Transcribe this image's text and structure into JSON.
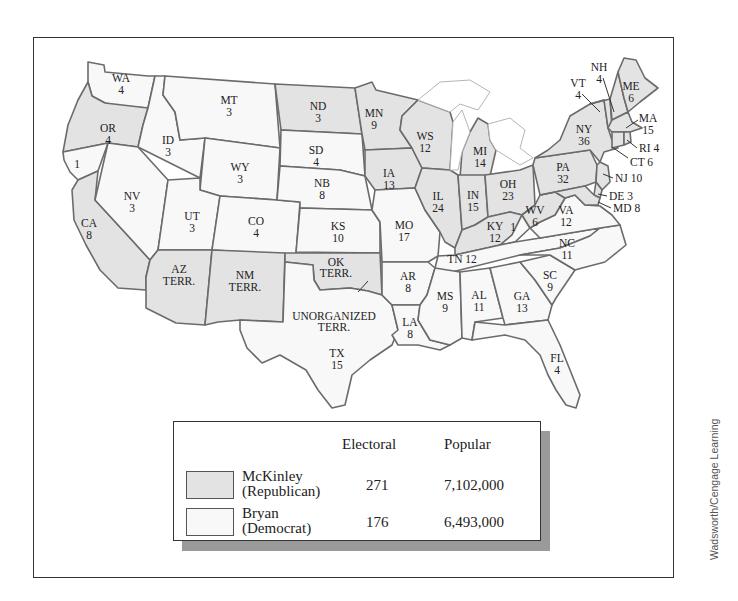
{
  "map": {
    "title": "Election of 1896",
    "colors": {
      "republican": "#e3e3e3",
      "democrat": "#f8f8f8",
      "border": "#6b6b6b"
    },
    "states": [
      {
        "abbr": "WA",
        "votes": "4",
        "party": "democrat"
      },
      {
        "abbr": "OR",
        "votes": "4",
        "party": "republican"
      },
      {
        "abbr": "CA",
        "votes": "8",
        "party": "republican",
        "split_note": "1"
      },
      {
        "abbr": "ID",
        "votes": "3",
        "party": "democrat"
      },
      {
        "abbr": "NV",
        "votes": "3",
        "party": "democrat"
      },
      {
        "abbr": "MT",
        "votes": "3",
        "party": "democrat"
      },
      {
        "abbr": "WY",
        "votes": "3",
        "party": "democrat"
      },
      {
        "abbr": "UT",
        "votes": "3",
        "party": "democrat"
      },
      {
        "abbr": "CO",
        "votes": "4",
        "party": "democrat"
      },
      {
        "abbr": "AZ",
        "votes": "TERR.",
        "party": "republican"
      },
      {
        "abbr": "NM",
        "votes": "TERR.",
        "party": "republican"
      },
      {
        "abbr": "ND",
        "votes": "3",
        "party": "republican"
      },
      {
        "abbr": "SD",
        "votes": "4",
        "party": "democrat"
      },
      {
        "abbr": "NB",
        "votes": "8",
        "party": "democrat"
      },
      {
        "abbr": "KS",
        "votes": "10",
        "party": "democrat"
      },
      {
        "abbr": "OK",
        "votes": "TERR.",
        "party": "republican"
      },
      {
        "abbr": "TX",
        "votes": "15",
        "party": "democrat"
      },
      {
        "abbr": "MN",
        "votes": "9",
        "party": "republican"
      },
      {
        "abbr": "IA",
        "votes": "13",
        "party": "republican"
      },
      {
        "abbr": "MO",
        "votes": "17",
        "party": "democrat"
      },
      {
        "abbr": "AR",
        "votes": "8",
        "party": "democrat"
      },
      {
        "abbr": "LA",
        "votes": "8",
        "party": "democrat"
      },
      {
        "abbr": "WS",
        "votes": "12",
        "party": "republican"
      },
      {
        "abbr": "IL",
        "votes": "24",
        "party": "republican"
      },
      {
        "abbr": "MI",
        "votes": "14",
        "party": "republican"
      },
      {
        "abbr": "IN",
        "votes": "15",
        "party": "republican"
      },
      {
        "abbr": "OH",
        "votes": "23",
        "party": "republican"
      },
      {
        "abbr": "KY",
        "votes": "12",
        "party": "republican",
        "split_note": "1"
      },
      {
        "abbr": "TN",
        "votes": "12",
        "party": "democrat"
      },
      {
        "abbr": "MS",
        "votes": "9",
        "party": "democrat"
      },
      {
        "abbr": "AL",
        "votes": "11",
        "party": "democrat"
      },
      {
        "abbr": "GA",
        "votes": "13",
        "party": "democrat"
      },
      {
        "abbr": "FL",
        "votes": "4",
        "party": "democrat"
      },
      {
        "abbr": "SC",
        "votes": "9",
        "party": "democrat"
      },
      {
        "abbr": "NC",
        "votes": "11",
        "party": "democrat"
      },
      {
        "abbr": "VA",
        "votes": "12",
        "party": "democrat"
      },
      {
        "abbr": "WV",
        "votes": "6",
        "party": "republican"
      },
      {
        "abbr": "PA",
        "votes": "32",
        "party": "republican"
      },
      {
        "abbr": "NY",
        "votes": "36",
        "party": "republican"
      },
      {
        "abbr": "VT",
        "votes": "4",
        "party": "republican"
      },
      {
        "abbr": "NH",
        "votes": "4",
        "party": "republican"
      },
      {
        "abbr": "ME",
        "votes": "6",
        "party": "republican"
      },
      {
        "abbr": "MA",
        "votes": "15",
        "party": "republican"
      },
      {
        "abbr": "RI",
        "votes": "4",
        "party": "republican"
      },
      {
        "abbr": "CT",
        "votes": "6",
        "party": "republican"
      },
      {
        "abbr": "NJ",
        "votes": "10",
        "party": "republican"
      },
      {
        "abbr": "DE",
        "votes": "3",
        "party": "republican"
      },
      {
        "abbr": "MD",
        "votes": "8",
        "party": "republican"
      }
    ],
    "labels": {
      "wa": [
        "WA",
        "4"
      ],
      "or": [
        "OR",
        "4"
      ],
      "ca": [
        "CA",
        "8"
      ],
      "ca_split": "1",
      "id": [
        "ID",
        "3"
      ],
      "nv": [
        "NV",
        "3"
      ],
      "mt": [
        "MT",
        "3"
      ],
      "wy": [
        "WY",
        "3"
      ],
      "ut": [
        "UT",
        "3"
      ],
      "co": [
        "CO",
        "4"
      ],
      "az": [
        "AZ",
        "TERR."
      ],
      "nm": [
        "NM",
        "TERR."
      ],
      "nd": [
        "ND",
        "3"
      ],
      "sd": [
        "SD",
        "4"
      ],
      "nb": [
        "NB",
        "8"
      ],
      "ks": [
        "KS",
        "10"
      ],
      "ok": [
        "OK",
        "TERR."
      ],
      "unorg": [
        "UNORGANIZED",
        "TERR."
      ],
      "tx": [
        "TX",
        "15"
      ],
      "mn": [
        "MN",
        "9"
      ],
      "ia": [
        "IA",
        "13"
      ],
      "mo": [
        "MO",
        "17"
      ],
      "ar": [
        "AR",
        "8"
      ],
      "la": [
        "LA",
        "8"
      ],
      "ws": [
        "WS",
        "12"
      ],
      "il": [
        "IL",
        "24"
      ],
      "mi": [
        "MI",
        "14"
      ],
      "in": [
        "IN",
        "15"
      ],
      "oh": [
        "OH",
        "23"
      ],
      "ky": [
        "KY",
        "12"
      ],
      "ky_split": "1",
      "tn": "TN 12",
      "ms": [
        "MS",
        "9"
      ],
      "al": [
        "AL",
        "11"
      ],
      "ga": [
        "GA",
        "13"
      ],
      "fl": [
        "FL",
        "4"
      ],
      "sc": [
        "SC",
        "9"
      ],
      "nc": [
        "NC",
        "11"
      ],
      "va": [
        "VA",
        "12"
      ],
      "wv": [
        "WV",
        "6"
      ],
      "pa": [
        "PA",
        "32"
      ],
      "ny": [
        "NY",
        "36"
      ],
      "vt": [
        "VT",
        "4"
      ],
      "nh": [
        "NH",
        "4"
      ],
      "me": [
        "ME",
        "6"
      ],
      "ma": [
        "MA",
        "15"
      ],
      "ri": "RI 4",
      "ct": "CT 6",
      "nj": "NJ 10",
      "de": "DE 3",
      "md": "MD 8"
    }
  },
  "legend": {
    "col_electoral": "Electoral",
    "col_popular": "Popular",
    "rows": [
      {
        "name_line1": "McKinley",
        "name_line2": "(Republican)",
        "electoral": "271",
        "popular": "7,102,000",
        "party": "republican"
      },
      {
        "name_line1": "Bryan",
        "name_line2": "(Democrat)",
        "electoral": "176",
        "popular": "6,493,000",
        "party": "democrat"
      }
    ]
  },
  "credit": "Wadsworth/Cengage Learning"
}
